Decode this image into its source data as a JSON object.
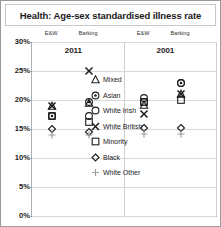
{
  "title": "Health: Age-sex standardised illness rate",
  "chart_data": {
    "type": "scatter",
    "title": "Health: Age-sex standardised illness rate",
    "xlabel": "",
    "ylabel": "",
    "ylim": [
      0,
      30
    ],
    "ytick_labels": [
      "0%",
      "5%",
      "10%",
      "15%",
      "20%",
      "25%",
      "30%"
    ],
    "ytick_values": [
      0,
      5,
      10,
      15,
      20,
      25,
      30
    ],
    "grid": true,
    "legend_position": "center",
    "panels": [
      {
        "label": "2011",
        "columns": [
          "E&W",
          "Barking"
        ]
      },
      {
        "label": "2001",
        "columns": [
          "E&W",
          "Barking"
        ]
      }
    ],
    "column_headers": [
      "E&W",
      "Barking",
      "E&W",
      "Barking"
    ],
    "series": [
      {
        "name": "Mixed",
        "marker": "triangle",
        "values": [
          19.0,
          19.5,
          19.2,
          21.0
        ]
      },
      {
        "name": "Asian",
        "marker": "circle-dot",
        "values": [
          17.3,
          19.6,
          19.6,
          23.0
        ]
      },
      {
        "name": "White Irish",
        "marker": "open-circle",
        "values": [
          17.3,
          17.3,
          20.3,
          23.0
        ]
      },
      {
        "name": "White British",
        "marker": "cross-x",
        "values": [
          19.0,
          25.0,
          17.6,
          21.0
        ]
      },
      {
        "name": "Minority",
        "marker": "open-square",
        "values": [
          17.3,
          16.2,
          19.6,
          20.0
        ]
      },
      {
        "name": "Black",
        "marker": "diamond",
        "values": [
          15.0,
          14.5,
          15.2,
          15.2
        ]
      },
      {
        "name": "White Other",
        "marker": "plus",
        "values": [
          14.0,
          14.0,
          14.2,
          14.2
        ]
      }
    ]
  },
  "legend": {
    "items": [
      {
        "label": "Mixed",
        "marker": "triangle"
      },
      {
        "label": "Asian",
        "marker": "circle-dot"
      },
      {
        "label": "White Irish",
        "marker": "open-circle"
      },
      {
        "label": "White British",
        "marker": "cross-x"
      },
      {
        "label": "Minority",
        "marker": "open-square"
      },
      {
        "label": "Black",
        "marker": "diamond"
      },
      {
        "label": "White Other",
        "marker": "plus"
      }
    ]
  }
}
